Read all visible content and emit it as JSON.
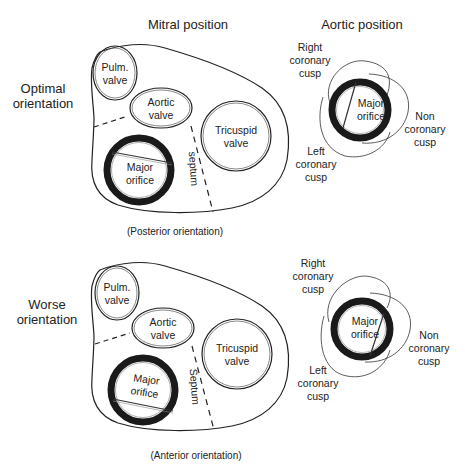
{
  "headers": {
    "mitral": "Mitral position",
    "aortic": "Aortic position"
  },
  "rows": [
    {
      "label_line1": "Optimal",
      "label_line2": "orientation",
      "caption": "(Posterior orientation)",
      "septum_label": "septum"
    },
    {
      "label_line1": "Worse",
      "label_line2": "orientation",
      "caption": "(Anterior orientation)",
      "septum_label": "Septum"
    }
  ],
  "valves": {
    "pulm_line1": "Pulm.",
    "pulm_line2": "valve",
    "aortic_line1": "Aortic",
    "aortic_line2": "valve",
    "tricuspid_line1": "Tricuspid",
    "tricuspid_line2": "valve",
    "major_line1": "Major",
    "major_line2": "orifice"
  },
  "cusps": {
    "right_line1": "Right",
    "right_line2": "coronary",
    "right_line3": "cusp",
    "left_line1": "Left",
    "left_line2": "coronary",
    "left_line3": "cusp",
    "non_line1": "Non",
    "non_line2": "coronary",
    "non_line3": "cusp"
  },
  "colors": {
    "stroke": "#222222",
    "ring": "#1a1a1a",
    "background": "#ffffff"
  }
}
